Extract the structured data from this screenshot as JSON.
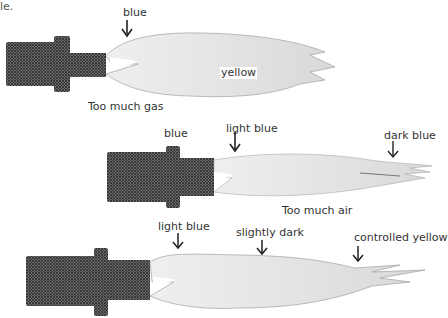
{
  "fragment_text": "le.",
  "diagrams": [
    {
      "id": "too-much-gas",
      "caption": "Too much gas",
      "labels": {
        "base": "blue",
        "body": "yellow"
      }
    },
    {
      "id": "too-much-air",
      "caption": "Too much air",
      "labels": {
        "nozzle": "blue",
        "base": "light blue",
        "tip": "dark blue"
      }
    },
    {
      "id": "correct",
      "caption": "",
      "labels": {
        "base": "light blue",
        "middle": "slightly dark",
        "tip": "controlled yellow"
      }
    }
  ],
  "colors": {
    "nozzle": "#4a4a4a",
    "flame": "#e6e6e6",
    "flame_edge": "#9a9a9a",
    "arrow": "#222222"
  }
}
